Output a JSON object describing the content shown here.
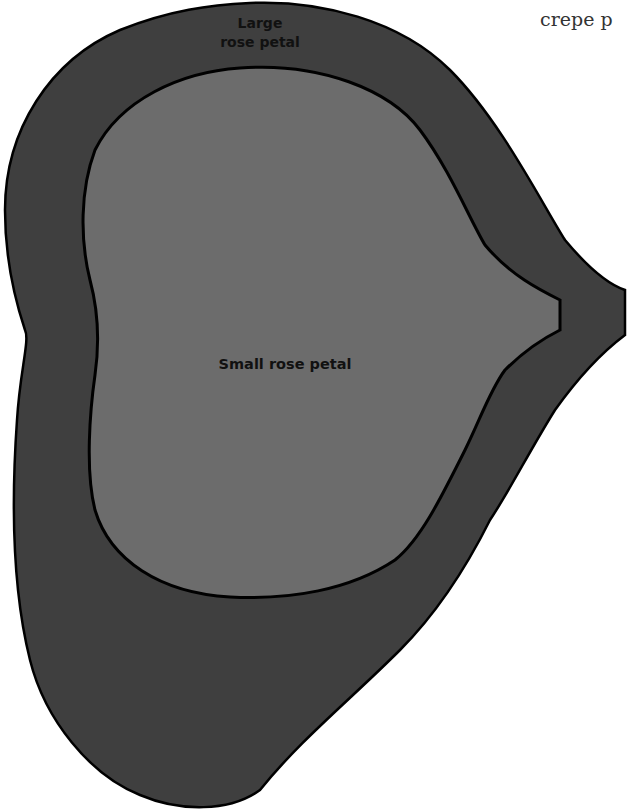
{
  "page": {
    "cutoff_text": "crepe p"
  },
  "diagram": {
    "shapes": [
      {
        "name": "Large rose petal",
        "fill": "#3f3f3f",
        "stroke": "#000000"
      },
      {
        "name": "Small rose petal",
        "fill": "#6c6c6c",
        "stroke": "#000000"
      }
    ],
    "labels": {
      "large_line1": "Large",
      "large_line2": "rose petal",
      "small": "Small rose petal"
    },
    "background": "#ffffff"
  }
}
